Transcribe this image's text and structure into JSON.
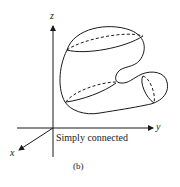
{
  "figure": {
    "axis_labels": {
      "x": "x",
      "y": "y",
      "z": "z"
    },
    "region_label": "Simply connected",
    "subfigure_label": "(b)",
    "region_type": "simply connected solid region",
    "ink_color": "#1a1a1a",
    "background_color": "#ffffff"
  }
}
